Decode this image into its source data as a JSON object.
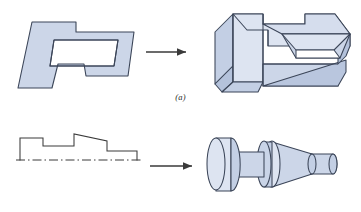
{
  "figure": {
    "panels": [
      {
        "id": "a",
        "caption": "(a)",
        "operation": "extrusion",
        "source_label": "2D closed profile with interior rectangular window",
        "result_label": "Extruded prismatic solid with through pocket",
        "arrow_label": "transform-arrow"
      },
      {
        "id": "b",
        "caption": "(b)",
        "operation": "revolution",
        "source_label": "Stepped half-profile above dash-dot centerline",
        "result_label": "Axisymmetric revolved solid with cylinders and taper",
        "arrow_label": "transform-arrow"
      }
    ]
  },
  "style": {
    "fill": "#ccd6e8",
    "fill_light": "#dde4f1",
    "fill_mid": "#c3cfe4",
    "fill_dark": "#b4c2db",
    "fill_white": "#ffffff",
    "stroke": "#3b4558",
    "line": "#3a3a3a",
    "arrow": "#3a3a3a"
  },
  "geometry": {
    "profile_a": "M 32,22 L 76,22 L 76,32 L 116,32 L 134,32 L 128,76 L 86,76 L 84,64 L 58,64 L 52,88 L 18,88 Z",
    "window_a": "M 54,40 L 118,40 L 114,66 L 50,66 Z",
    "profile_b_outline": "M 20,160 L 20,138 L 43,138 L 43,146 L 74,146 L 74,134 L 107,141 L 107,151 L 137,151 L 137,160",
    "centerline_b": "M 16,160 L 142,160"
  }
}
